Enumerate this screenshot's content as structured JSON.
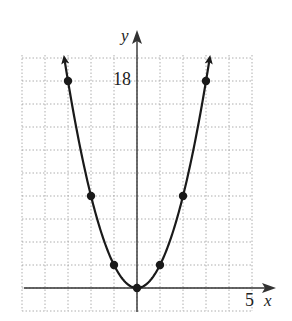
{
  "chart_data": {
    "type": "line",
    "title": "",
    "equation": "y = 2x^2",
    "xlabel": "x",
    "ylabel": "y",
    "x_tick_labels": [
      {
        "value": 5,
        "label": "5"
      }
    ],
    "y_tick_labels": [
      {
        "value": 18,
        "label": "18"
      }
    ],
    "xlim": [
      -5,
      5
    ],
    "ylim": [
      -2,
      20
    ],
    "grid": true,
    "grid_x_step": 1,
    "grid_y_step": 2,
    "points": [
      {
        "x": -3,
        "y": 18
      },
      {
        "x": -2,
        "y": 8
      },
      {
        "x": -1,
        "y": 2
      },
      {
        "x": 0,
        "y": 0
      },
      {
        "x": 1,
        "y": 2
      },
      {
        "x": 2,
        "y": 8
      },
      {
        "x": 3,
        "y": 18
      }
    ],
    "curve_arrows": true,
    "legend": null
  },
  "labels": {
    "x_axis": "x",
    "y_axis": "y",
    "x_tick": "5",
    "y_tick": "18"
  },
  "colors": {
    "curve": "#1a1a1a",
    "grid": "#9a9a9a",
    "axes": "#333333"
  }
}
